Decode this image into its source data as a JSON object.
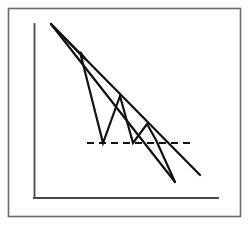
{
  "figure": {
    "title": "",
    "background_color": "#ffffff",
    "width": 249,
    "height": 225
  },
  "chart_data": {
    "type": "line",
    "title": "",
    "subtitle": "",
    "xlabel": "",
    "ylabel": "",
    "grid": false,
    "legend": false,
    "legend_position": "none",
    "axis_color": "#4a4a4a",
    "line_color": "#111111",
    "xlim": [
      0,
      100
    ],
    "ylim": [
      0,
      100
    ],
    "annotations": [],
    "tick_labels": {
      "x": [],
      "y": []
    },
    "series": [
      {
        "name": "price-zigzag",
        "role": "price-path",
        "style": "solid",
        "color": "#111111",
        "points": [
          [
            51,
            24
          ],
          [
            86,
            60
          ],
          [
            80,
            52
          ],
          [
            103,
            143
          ],
          [
            120,
            96
          ],
          [
            133,
            143
          ],
          [
            147,
            124
          ],
          [
            156,
            140
          ],
          [
            175,
            182
          ]
        ]
      },
      {
        "name": "upper-trendline",
        "role": "resistance-inner",
        "style": "solid",
        "color": "#111111",
        "points": [
          [
            51,
            24
          ],
          [
            175,
            182
          ]
        ]
      },
      {
        "name": "lower-trendline",
        "role": "resistance-outer",
        "style": "solid",
        "color": "#111111",
        "points": [
          [
            51,
            24
          ],
          [
            200,
            175
          ]
        ]
      },
      {
        "name": "support-line",
        "role": "support",
        "style": "dashed",
        "color": "#111111",
        "points": [
          [
            87,
            143
          ],
          [
            195,
            143
          ]
        ]
      }
    ],
    "axes": {
      "y_axis": {
        "x": 34,
        "y_top": 24,
        "y_bottom": 198
      },
      "x_axis": {
        "y": 198,
        "x_left": 34,
        "x_right": 218
      }
    },
    "frame": {
      "x": 8,
      "y": 8,
      "width": 232,
      "height": 208
    }
  }
}
